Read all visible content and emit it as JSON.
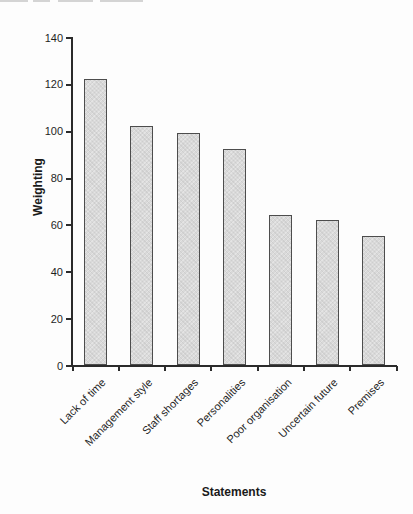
{
  "page": {
    "background": "#fdfdfd"
  },
  "scan_artifact": {
    "description": "faint bottom edge of a cropped text line at top of scan",
    "color": "#d4d4d4",
    "segments": [
      {
        "x": 0,
        "width": 28
      },
      {
        "x": 33,
        "width": 17
      },
      {
        "x": 58,
        "width": 35
      },
      {
        "x": 100,
        "width": 43
      }
    ]
  },
  "chart_data": {
    "type": "bar",
    "title": "",
    "categories": [
      "Lack of time",
      "Management style",
      "Staff shortages",
      "Personalities",
      "Poor organisation",
      "Uncertain future",
      "Premises"
    ],
    "values": [
      122,
      102,
      99,
      92,
      64,
      62,
      55
    ],
    "xlabel": "Statements",
    "ylabel": "Weighting",
    "ylim": [
      0,
      140
    ],
    "yticks": [
      0,
      20,
      40,
      60,
      80,
      100,
      120,
      140
    ],
    "grid": false,
    "legend": false,
    "bar_fill": "#d9d9d9",
    "bar_border": "#4d4d4d",
    "axis_color": "#2b2b2b",
    "text_color": "#1f1f1f",
    "category_label_angle_deg": -45
  }
}
